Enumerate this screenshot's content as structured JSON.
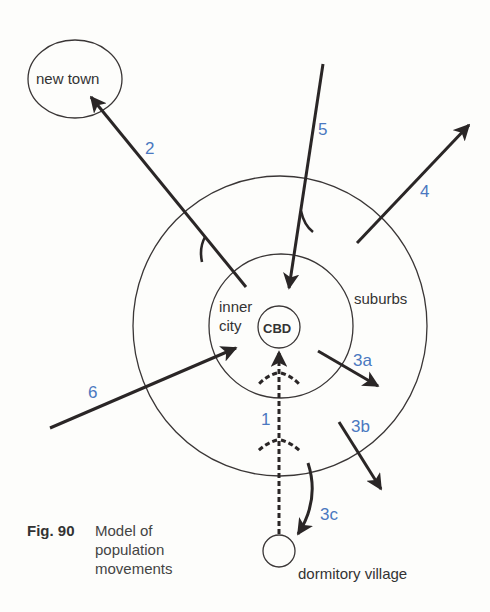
{
  "figure": {
    "number_label": "Fig. 90",
    "title_lines": [
      "Model of",
      "population",
      "movements"
    ]
  },
  "places": {
    "new_town": "new town",
    "inner_city_line1": "inner",
    "inner_city_line2": "city",
    "cbd": "CBD",
    "suburbs": "suburbs",
    "dormitory_village": "dormitory village"
  },
  "movements": [
    {
      "id": "1",
      "label": "1",
      "from": "dormitory village",
      "to": "CBD",
      "style": "dashed"
    },
    {
      "id": "2",
      "label": "2",
      "from": "inner city",
      "to": "new town",
      "style": "solid"
    },
    {
      "id": "3a",
      "label": "3a",
      "from": "inner city",
      "to": "suburbs",
      "style": "solid"
    },
    {
      "id": "3b",
      "label": "3b",
      "from": "suburbs",
      "to": "outside",
      "style": "solid"
    },
    {
      "id": "3c",
      "label": "3c",
      "from": "suburbs",
      "to": "dormitory village",
      "style": "solid"
    },
    {
      "id": "4",
      "label": "4",
      "from": "suburbs",
      "to": "outside",
      "style": "solid"
    },
    {
      "id": "5",
      "label": "5",
      "from": "outside",
      "to": "inner city",
      "style": "solid"
    },
    {
      "id": "6",
      "label": "6",
      "from": "outside",
      "to": "inner city",
      "style": "solid"
    }
  ],
  "colors": {
    "line": "#2a2626",
    "label_blue": "#4a78c0",
    "text": "#333333",
    "background": "#fdfdfb"
  }
}
